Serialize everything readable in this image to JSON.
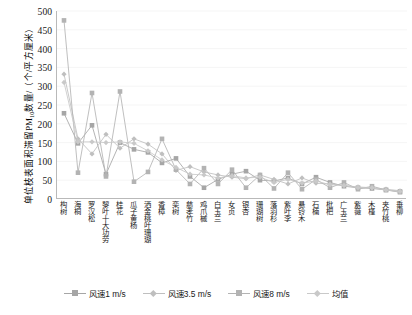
{
  "chart_data": {
    "type": "line",
    "title": "",
    "xlabel": "",
    "ylabel_text": "单位枝表面积滞留PM",
    "ylabel_sub": "10",
    "ylabel_tail": "数量/（个/平方厘米）",
    "ylim": [
      0,
      500
    ],
    "yticks": [
      0,
      50,
      100,
      150,
      200,
      250,
      300,
      350,
      400,
      450,
      500
    ],
    "grid": "horizontal-light",
    "legend_position": "bottom-center",
    "categories": [
      "构树",
      "海桐",
      "罗汉松",
      "黎叶十大功劳",
      "桂花",
      "瓜子黄杨",
      "洒金桃叶珊瑚",
      "香樟",
      "栾树",
      "慈孝竹",
      "鸡爪槭",
      "白玉兰",
      "女贞",
      "银杏",
      "珊瑚树",
      "落羽杉",
      "紫叶李",
      "悬铃木",
      "石楠",
      "枇杷",
      "广玉兰",
      "紫薇",
      "木槿",
      "夹竹桃",
      "垂柳"
    ],
    "series": [
      {
        "name": "风速1 m/s",
        "color": "#a6a6a6",
        "marker": "square",
        "values": [
          228,
          148,
          196,
          66,
          150,
          132,
          124,
          96,
          108,
          60,
          30,
          52,
          66,
          74,
          50,
          48,
          56,
          40,
          58,
          44,
          34,
          30,
          28,
          24,
          20
        ]
      },
      {
        "name": "风速3.5 m/s",
        "color": "#bfbfbf",
        "marker": "diamond",
        "values": [
          332,
          160,
          120,
          172,
          135,
          160,
          146,
          120,
          76,
          86,
          72,
          64,
          58,
          54,
          64,
          52,
          40,
          56,
          42,
          40,
          36,
          32,
          30,
          26,
          22
        ]
      },
      {
        "name": "风速8 m/s",
        "color": "#b3b3b3",
        "marker": "square",
        "values": [
          475,
          70,
          282,
          60,
          286,
          46,
          72,
          160,
          78,
          40,
          82,
          40,
          78,
          30,
          64,
          28,
          70,
          26,
          52,
          30,
          44,
          26,
          34,
          24,
          18
        ]
      },
      {
        "name": "均值",
        "color": "#c9c9c9",
        "marker": "diamond",
        "values": [
          310,
          152,
          152,
          150,
          152,
          148,
          128,
          104,
          84,
          66,
          64,
          56,
          62,
          56,
          58,
          44,
          52,
          42,
          48,
          38,
          36,
          30,
          30,
          24,
          20
        ]
      }
    ],
    "legend": [
      {
        "label": "风速1 m/s",
        "color": "#a6a6a6",
        "marker": "square"
      },
      {
        "label": "风速3.5 m/s",
        "color": "#bfbfbf",
        "marker": "diamond"
      },
      {
        "label": "风速8 m/s",
        "color": "#b3b3b3",
        "marker": "square"
      },
      {
        "label": "均值",
        "color": "#c9c9c9",
        "marker": "diamond"
      }
    ]
  }
}
